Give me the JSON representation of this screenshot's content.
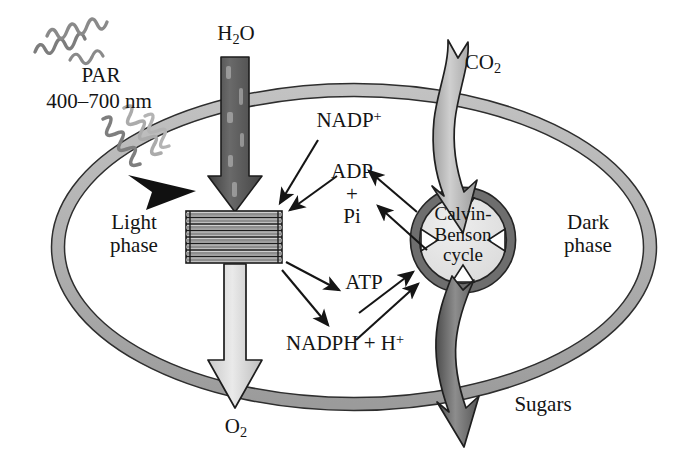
{
  "figure": {
    "type": "biological-process-diagram",
    "background_color": "#ffffff",
    "line_color": "#1a1a1a"
  },
  "colors": {
    "envelope_fill": "#b0b0b0",
    "envelope_stroke": "#2b2b2b",
    "cycle_ring": "#6d6d6d",
    "cycle_inner": "#e2e2e2",
    "thylakoid_band": "#9a9a9a",
    "water_arrow": "#4a4a4a",
    "oxygen_arrow": "#d7d7d7",
    "co2_ribbon": "#b6b6b6",
    "sugars_ribbon": "#6a6a6a",
    "squiggle": "#7b7b7b",
    "squiggle_light": "#adadad"
  },
  "labels": {
    "par_name": "PAR",
    "par_range": "400–700 nm",
    "water": {
      "text": "H",
      "sub": "2",
      "tail": "O"
    },
    "oxygen": {
      "text": "O",
      "sub": "2"
    },
    "carbon_dioxide": {
      "text": "CO",
      "sub": "2"
    },
    "sugars": "Sugars",
    "light_phase_line1": "Light",
    "light_phase_line2": "phase",
    "dark_phase_line1": "Dark",
    "dark_phase_line2": "phase",
    "nadp_plus": {
      "text": "NADP",
      "sup": "+"
    },
    "adp_line1": "ADP",
    "adp_line2": "+",
    "adp_line3": "Pi",
    "atp": "ATP",
    "nadph": {
      "text": "NADPH + H",
      "sup": "+"
    },
    "cycle_line1": "Calvin-",
    "cycle_line2": "Benson",
    "cycle_line3": "cycle"
  },
  "structures": {
    "chloroplast_envelope": "chloroplast-envelope-ellipse",
    "granum": "thylakoid-granum-stack",
    "granum_layers": 8,
    "calvin_cycle": "calvin-benson-cycle-ring",
    "cycle_arrowheads": 4
  },
  "flows": [
    {
      "name": "par-light-in",
      "from": "PAR 400–700 nm",
      "to": "Light phase"
    },
    {
      "name": "water-in",
      "from": "H2O",
      "to": "granum"
    },
    {
      "name": "oxygen-out",
      "from": "granum",
      "to": "O2"
    },
    {
      "name": "co2-in",
      "from": "CO2",
      "to": "Calvin-Benson cycle"
    },
    {
      "name": "sugars-out",
      "from": "Calvin-Benson cycle",
      "to": "Sugars"
    },
    {
      "name": "nadp-to-granum",
      "from": "NADP+",
      "to": "granum"
    },
    {
      "name": "adp-pi-to-granum",
      "from": "ADP + Pi",
      "to": "granum"
    },
    {
      "name": "granum-to-atp",
      "from": "granum",
      "to": "ATP"
    },
    {
      "name": "granum-to-nadph",
      "from": "granum",
      "to": "NADPH + H+"
    },
    {
      "name": "cycle-to-nadp",
      "from": "Calvin-Benson cycle",
      "to": "NADP+"
    },
    {
      "name": "cycle-to-adp-pi",
      "from": "Calvin-Benson cycle",
      "to": "ADP + Pi"
    },
    {
      "name": "atp-to-cycle",
      "from": "ATP",
      "to": "Calvin-Benson cycle"
    },
    {
      "name": "nadph-to-cycle",
      "from": "NADPH + H+",
      "to": "Calvin-Benson cycle"
    }
  ]
}
